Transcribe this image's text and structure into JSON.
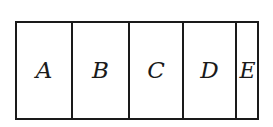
{
  "diagram": {
    "type": "partitioned-rectangle",
    "regions": [
      {
        "label": "A",
        "width": 54
      },
      {
        "label": "B",
        "width": 57
      },
      {
        "label": "C",
        "width": 54
      },
      {
        "label": "D",
        "width": 53
      },
      {
        "label": "E",
        "width": 26
      }
    ],
    "stroke_color": "#1a1a1a",
    "background_color": "#ffffff"
  }
}
